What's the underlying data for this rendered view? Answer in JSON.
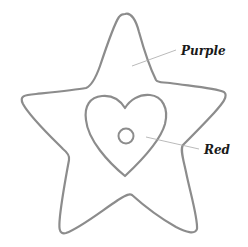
{
  "figure": {
    "shapes": [
      {
        "name": "star",
        "color_label": "Purple"
      },
      {
        "name": "heart",
        "color_label": "Red"
      },
      {
        "name": "circle",
        "color_label": ""
      }
    ],
    "labels": {
      "purple": "Purple",
      "red": "Red"
    },
    "colors": {
      "outline": "#8c8c8c",
      "leader_line": "#a8a8a8",
      "background": "#ffffff",
      "text": "#1a1a1a"
    }
  }
}
